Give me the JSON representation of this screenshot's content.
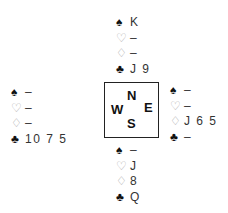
{
  "suits": {
    "spades": "♠",
    "hearts": "♡",
    "diamonds": "♢",
    "clubs": "♣"
  },
  "compass": {
    "north": "N",
    "south": "S",
    "east": "E",
    "west": "W"
  },
  "hands": {
    "north": {
      "spades": "K",
      "hearts": "–",
      "diamonds": "–",
      "clubs": "J 9"
    },
    "west": {
      "spades": "–",
      "hearts": "–",
      "diamonds": "–",
      "clubs": "10 7 5"
    },
    "east": {
      "spades": "–",
      "hearts": "–",
      "diamonds": "J 6 5",
      "clubs": "–"
    },
    "south": {
      "spades": "–",
      "hearts": "J",
      "diamonds": "8",
      "clubs": "Q"
    }
  }
}
